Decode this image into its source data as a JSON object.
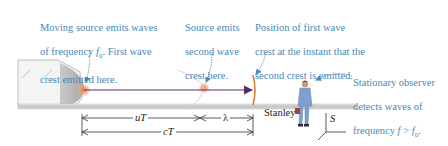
{
  "figure": {
    "topic": "Doppler effect: moving source, stationary observer",
    "callouts": {
      "source_first_crest": {
        "line1": "Moving source emits waves",
        "line2_prefix": "of frequency ",
        "line2_var": "f",
        "line2_sub": "0",
        "line2_suffix": ". First wave",
        "line3": "crest emitted here."
      },
      "source_second_crest": {
        "line1": "Source emits",
        "line2": "second wave",
        "line3": "crest here."
      },
      "first_crest_position": {
        "line1": "Position of first wave",
        "line2": "crest at the instant that the",
        "line3": "second crest is emitted."
      },
      "observer": {
        "line1": "Stationary observer",
        "line2": "detects waves of",
        "line3_prefix": "frequency ",
        "line3_var": "f",
        "line3_op": " > ",
        "line3_var2": "f",
        "line3_sub": "0",
        "line3_suffix": "."
      }
    },
    "dimensions": {
      "uT": "uT",
      "lambda": "λ",
      "cT": "cT"
    },
    "observer_name": "Stanley",
    "frame_label": "S",
    "colors": {
      "callout_text": "#4a88b5",
      "callout_arrow": "#4a88b5",
      "wave_crest": "#e07a3c",
      "source_glow": "#f0a070",
      "velocity_arrow": "#5a2a6a",
      "track": "#c8c8c8",
      "source_body": "#b8b8b8",
      "observer_suit": "#7f9fcf",
      "briefcase": "#9a4a2a"
    }
  }
}
